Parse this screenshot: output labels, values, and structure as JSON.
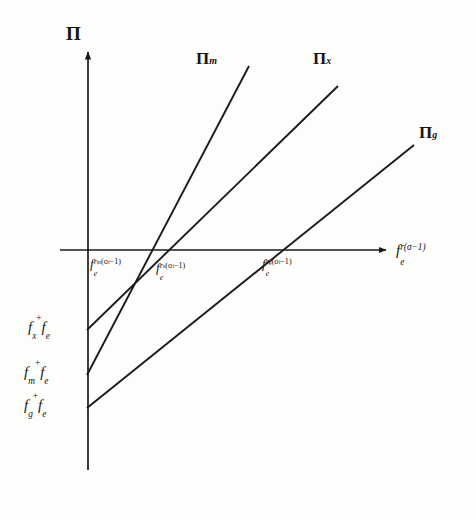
{
  "figure": {
    "kind": "line-diagram",
    "background_color": "#fdfdfc",
    "line_color": "#1b1b1b",
    "axis_color": "#1b1b1b"
  },
  "axes": {
    "y_title": "Π",
    "x_title_base": "f",
    "x_title_sub": "e",
    "x_title_sup": "r(σ−1)",
    "origin": {
      "x": 88,
      "y": 250
    },
    "x_axis_end": {
      "x": 390,
      "y": 250
    },
    "y_axis_top": {
      "x": 88,
      "y": 48
    },
    "y_axis_bottom": {
      "x": 88,
      "y": 470
    }
  },
  "curves": [
    {
      "name": "pi-m",
      "label_base": "Π",
      "label_sub": "m",
      "label_x": 196,
      "label_y": 56,
      "y_intercept_px": 375,
      "x_crossing_px": 140,
      "x1": 87,
      "y1": 375,
      "x2": 249,
      "y2": 66
    },
    {
      "name": "pi-x",
      "label_base": "Π",
      "label_sub": "x",
      "label_x": 315,
      "label_y": 56,
      "y_intercept_px": 330,
      "x_crossing_px": 152,
      "x1": 87,
      "y1": 330,
      "x2": 338,
      "y2": 86
    },
    {
      "name": "pi-g",
      "label_base": "Π",
      "label_sub": "g",
      "label_x": 420,
      "label_y": 126,
      "y_intercept_px": 408,
      "x_crossing_px": 272,
      "x1": 87,
      "y1": 408,
      "x2": 414,
      "y2": 145
    }
  ],
  "x_tick_labels": [
    {
      "name": "tick-fe-rm",
      "base": "f",
      "sub": "e",
      "sup_base": "r",
      "sup_sub": "m",
      "sup_rest": "(σ",
      "sup_rest_sub": "i",
      "sup_tail": "−1)",
      "x": 90,
      "y": 258
    },
    {
      "name": "tick-fe-rx",
      "base": "f",
      "sub": "e",
      "sup_base": "r",
      "sup_sub": "x",
      "sup_rest": "(σ",
      "sup_rest_sub": "i",
      "sup_tail": "−1)",
      "x": 156,
      "y": 262
    },
    {
      "name": "tick-fe-rg",
      "base": "f",
      "sub": "e",
      "sup_base": "r",
      "sup_sub": "g",
      "sup_rest": "(σ",
      "sup_rest_sub": "i",
      "sup_tail": "−1)",
      "x": 262,
      "y": 258
    }
  ],
  "y_intercept_labels": [
    {
      "name": "intercept-fx-fe",
      "first_base": "f",
      "first_sub": "x",
      "operator": "+",
      "second_base": "f",
      "second_sub": "e",
      "x": 28,
      "y": 320
    },
    {
      "name": "intercept-fm-fe",
      "first_base": "f",
      "first_sub": "m",
      "operator": "+",
      "second_base": "f",
      "second_sub": "e",
      "x": 24,
      "y": 365
    },
    {
      "name": "intercept-fg-fe",
      "first_base": "f",
      "first_sub": "g",
      "operator": "+",
      "second_base": "f",
      "second_sub": "e",
      "x": 24,
      "y": 398
    }
  ]
}
